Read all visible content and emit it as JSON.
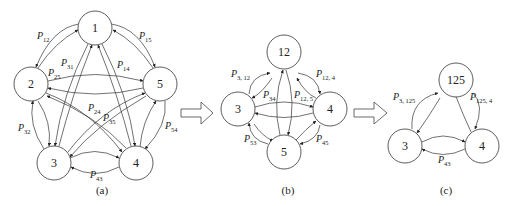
{
  "figure": {
    "panels": [
      {
        "id": "a",
        "caption": "(a)",
        "nodes": [
          {
            "id": "1",
            "label": "1"
          },
          {
            "id": "2",
            "label": "2"
          },
          {
            "id": "3",
            "label": "3"
          },
          {
            "id": "4",
            "label": "4"
          },
          {
            "id": "5",
            "label": "5"
          }
        ],
        "edge_labels": [
          {
            "p": "P",
            "sub": "12"
          },
          {
            "p": "P",
            "sub": "15"
          },
          {
            "p": "P",
            "sub": "31"
          },
          {
            "p": "P",
            "sub": "14"
          },
          {
            "p": "P",
            "sub": "25"
          },
          {
            "p": "P",
            "sub": "24"
          },
          {
            "p": "P",
            "sub": "35"
          },
          {
            "p": "P",
            "sub": "32"
          },
          {
            "p": "P",
            "sub": "54"
          },
          {
            "p": "P",
            "sub": "43"
          }
        ]
      },
      {
        "id": "b",
        "caption": "(b)",
        "nodes": [
          {
            "id": "12",
            "label": "12"
          },
          {
            "id": "3",
            "label": "3"
          },
          {
            "id": "4",
            "label": "4"
          },
          {
            "id": "5",
            "label": "5"
          }
        ],
        "edge_labels": [
          {
            "p": "P",
            "sub": "3, 12"
          },
          {
            "p": "P",
            "sub": "12, 4"
          },
          {
            "p": "P",
            "sub": "34"
          },
          {
            "p": "P",
            "sub": "12, 5"
          },
          {
            "p": "P",
            "sub": "53"
          },
          {
            "p": "P",
            "sub": "45"
          }
        ]
      },
      {
        "id": "c",
        "caption": "(c)",
        "nodes": [
          {
            "id": "125",
            "label": "125"
          },
          {
            "id": "3",
            "label": "3"
          },
          {
            "id": "4",
            "label": "4"
          }
        ],
        "edge_labels": [
          {
            "p": "P",
            "sub": "3, 125"
          },
          {
            "p": "P",
            "sub": "125, 4"
          },
          {
            "p": "P",
            "sub": "43"
          }
        ]
      }
    ],
    "transition_arrows": [
      "a-to-b",
      "b-to-c"
    ],
    "colors": {
      "stroke": "#333333",
      "background": "#ffffff"
    }
  }
}
